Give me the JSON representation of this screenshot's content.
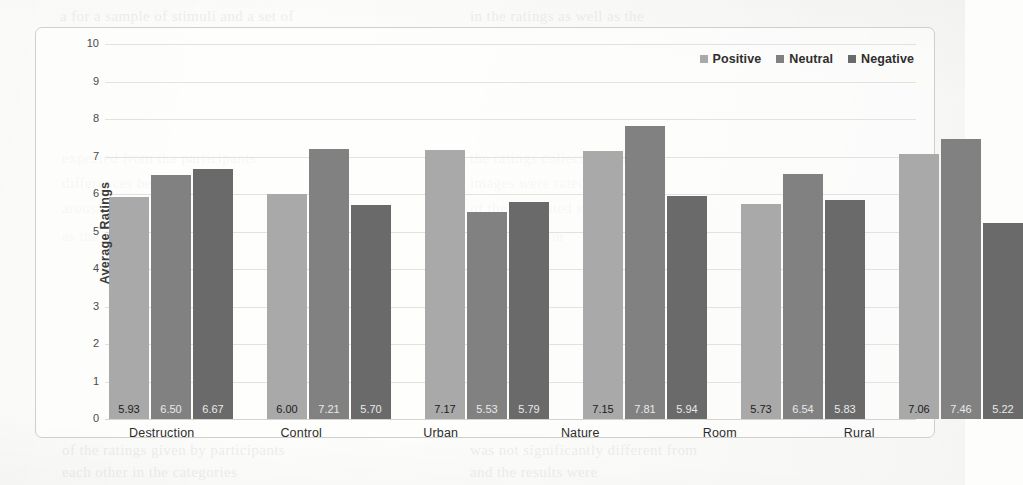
{
  "chart_data": {
    "type": "bar",
    "title": "",
    "xlabel": "",
    "ylabel": "Average Ratings",
    "ylim": [
      0,
      10
    ],
    "yticks": [
      10,
      9,
      8,
      7,
      6,
      5,
      4,
      3,
      2,
      1,
      0
    ],
    "grid": true,
    "legend_position": "top-right",
    "categories": [
      "Destruction",
      "Control",
      "Urban",
      "Nature",
      "Room",
      "Rural"
    ],
    "series": [
      {
        "name": "Positive",
        "color": "#a9a9a9",
        "values": [
          5.93,
          6.0,
          7.17,
          7.15,
          5.73,
          7.06
        ],
        "labels": [
          "5.93",
          "6.00",
          "7.17",
          "7.15",
          "5.73",
          "7.06"
        ]
      },
      {
        "name": "Neutral",
        "color": "#818181",
        "values": [
          6.5,
          7.21,
          5.53,
          7.81,
          6.54,
          7.46
        ],
        "labels": [
          "6.50",
          "7.21",
          "5.53",
          "7.81",
          "6.54",
          "7.46"
        ]
      },
      {
        "name": "Negative",
        "color": "#6a6a6a",
        "values": [
          6.67,
          5.7,
          5.79,
          5.94,
          5.83,
          5.22
        ],
        "labels": [
          "6.67",
          "5.70",
          "5.79",
          "5.94",
          "5.83",
          "5.22"
        ]
      }
    ]
  },
  "bleed_text": [
    {
      "t": "a for a sample of stimuli and a set of",
      "x": 60,
      "y": 8
    },
    {
      "t": "in the ratings as well as the",
      "x": 470,
      "y": 8
    },
    {
      "t": "expected from the participants",
      "x": 62,
      "y": 150
    },
    {
      "t": "the ratings collected and the",
      "x": 470,
      "y": 150
    },
    {
      "t": "differences between the",
      "x": 62,
      "y": 175
    },
    {
      "t": "images were rated on",
      "x": 470,
      "y": 175
    },
    {
      "t": "arousal and valence",
      "x": 62,
      "y": 200
    },
    {
      "t": "of the presented set",
      "x": 470,
      "y": 200
    },
    {
      "t": "as the stimuli were",
      "x": 62,
      "y": 228
    },
    {
      "t": "each condition",
      "x": 470,
      "y": 228
    },
    {
      "t": "of the ratings given by participants",
      "x": 62,
      "y": 442
    },
    {
      "t": "was not significantly different from",
      "x": 470,
      "y": 442
    },
    {
      "t": "each other in the categories",
      "x": 62,
      "y": 464
    },
    {
      "t": "and the results were",
      "x": 470,
      "y": 464
    }
  ]
}
